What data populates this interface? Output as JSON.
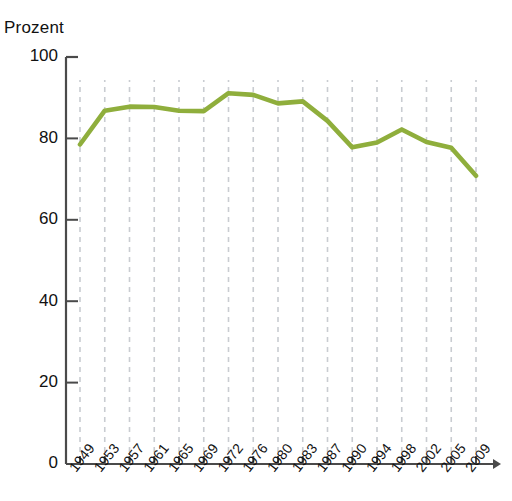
{
  "chart_data": {
    "type": "line",
    "title": "",
    "ylabel": "Prozent",
    "xlabel": "",
    "ylim": [
      0,
      100
    ],
    "yticks": [
      0,
      20,
      40,
      60,
      80,
      100
    ],
    "ytick_labels": [
      "0",
      "20",
      "40",
      "60",
      "80",
      "100"
    ],
    "grid": "vertical-dashed",
    "legend": "none",
    "categories": [
      "1949",
      "1953",
      "1957",
      "1961",
      "1965",
      "1969",
      "1972",
      "1976",
      "1980",
      "1983",
      "1987",
      "1990",
      "1994",
      "1998",
      "2002",
      "2005",
      "2009"
    ],
    "values": [
      78.5,
      86.8,
      87.8,
      87.7,
      86.8,
      86.7,
      91.1,
      90.7,
      88.6,
      89.1,
      84.3,
      77.8,
      79.0,
      82.2,
      79.1,
      77.7,
      70.8
    ],
    "series": [
      {
        "name": "Wahlbeteiligung",
        "color": "#8FAE3C",
        "values": [
          78.5,
          86.8,
          87.8,
          87.7,
          86.8,
          86.7,
          91.1,
          90.7,
          88.6,
          89.1,
          84.3,
          77.8,
          79.0,
          82.2,
          79.1,
          77.7,
          70.8
        ]
      }
    ],
    "colors": {
      "line": "#8FAE3C",
      "axis": "#4a4a4a",
      "grid": "#c9ccd1",
      "text": "#111111"
    }
  }
}
